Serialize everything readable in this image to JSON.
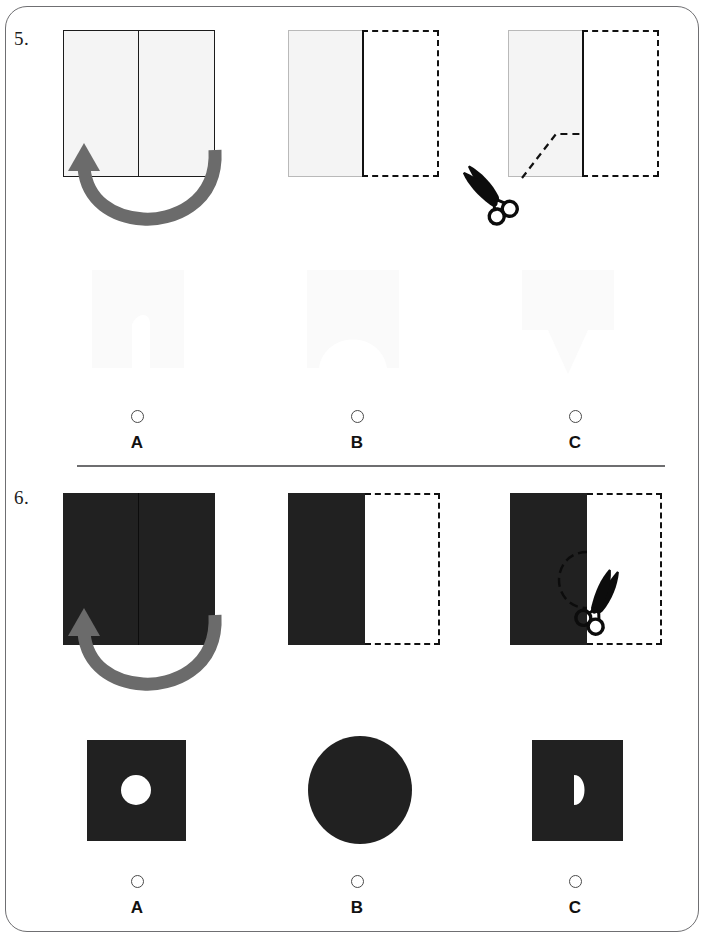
{
  "worksheet": {
    "type": "paper-folding-and-cutting-test",
    "background_color": "#ffffff",
    "card_border_color": "#6f6f72",
    "divider_color": "#6e6e70",
    "light_paper_color": "#f4f4f4",
    "dark_paper_color": "#212121",
    "ink_color": "#111111",
    "arrow_color": "#6b6b6b"
  },
  "questions": [
    {
      "number": "5.",
      "paper_shade": "light",
      "steps": [
        {
          "name": "unfolded-sheet-with-fold-arrow",
          "description": "Light rectangular sheet with vertical centre fold line and U-shaped fold arrow pointing up-left"
        },
        {
          "name": "folded-sheet",
          "description": "Left half solid light paper, right half dashed ghost outline"
        },
        {
          "name": "cut-sheet-with-scissors",
          "description": "Folded sheet with dashed cut line running diagonally up from the bottom edge then horizontally to the fold, scissors at lower left"
        }
      ],
      "options": [
        {
          "letter": "A",
          "shape": "square-with-narrow-tall-notch-from-bottom"
        },
        {
          "letter": "B",
          "shape": "square-with-wide-arched-notch-from-bottom"
        },
        {
          "letter": "C",
          "shape": "square-with-downward-triangle-below"
        }
      ]
    },
    {
      "number": "6.",
      "paper_shade": "dark",
      "steps": [
        {
          "name": "unfolded-sheet-with-fold-arrow",
          "description": "Dark rectangular sheet with vertical centre fold line and U-shaped fold arrow pointing up-left"
        },
        {
          "name": "folded-sheet",
          "description": "Left half solid dark paper, right half dashed ghost outline"
        },
        {
          "name": "cut-sheet-with-scissors",
          "description": "Folded dark sheet with semicircular dashed cut arc on the fold edge, scissors at lower right"
        }
      ],
      "options": [
        {
          "letter": "A",
          "shape": "dark-square-with-white-circular-hole-in-centre"
        },
        {
          "letter": "B",
          "shape": "solid-dark-ellipse"
        },
        {
          "letter": "C",
          "shape": "dark-square-with-white-half-disc-on-left-of-centre"
        }
      ]
    }
  ]
}
